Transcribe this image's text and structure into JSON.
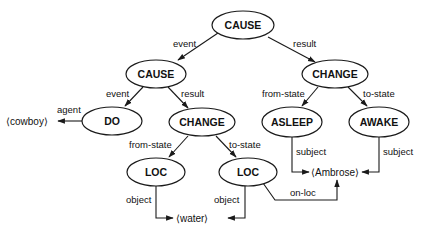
{
  "diagram": {
    "type": "conceptual-dependency-graph",
    "nodes": [
      {
        "id": "cause_root",
        "label": "CAUSE"
      },
      {
        "id": "cause_sub",
        "label": "CAUSE"
      },
      {
        "id": "change_right",
        "label": "CHANGE"
      },
      {
        "id": "do",
        "label": "DO"
      },
      {
        "id": "change_mid",
        "label": "CHANGE"
      },
      {
        "id": "asleep",
        "label": "ASLEEP"
      },
      {
        "id": "awake",
        "label": "AWAKE"
      },
      {
        "id": "loc_left",
        "label": "LOC"
      },
      {
        "id": "loc_right",
        "label": "LOC"
      }
    ],
    "leaves": [
      {
        "id": "cowboy",
        "label": "⟨cowboy⟩"
      },
      {
        "id": "ambrose",
        "label": "⟨Ambrose⟩"
      },
      {
        "id": "water",
        "label": "⟨water⟩"
      }
    ],
    "edges": [
      {
        "from": "cause_root",
        "to": "cause_sub",
        "label": "event"
      },
      {
        "from": "cause_root",
        "to": "change_right",
        "label": "result"
      },
      {
        "from": "cause_sub",
        "to": "do",
        "label": "event"
      },
      {
        "from": "cause_sub",
        "to": "change_mid",
        "label": "result"
      },
      {
        "from": "do",
        "to": "cowboy",
        "label": "agent"
      },
      {
        "from": "change_mid",
        "to": "loc_left",
        "label": "from-state"
      },
      {
        "from": "change_mid",
        "to": "loc_right",
        "label": "to-state"
      },
      {
        "from": "change_right",
        "to": "asleep",
        "label": "from-state"
      },
      {
        "from": "change_right",
        "to": "awake",
        "label": "to-state"
      },
      {
        "from": "asleep",
        "to": "ambrose",
        "label": "subject"
      },
      {
        "from": "awake",
        "to": "ambrose",
        "label": "subject"
      },
      {
        "from": "loc_left",
        "to": "water",
        "label": "object"
      },
      {
        "from": "loc_right",
        "to": "water",
        "label": "object"
      },
      {
        "from": "loc_right",
        "to": "ambrose",
        "label": "on-loc"
      }
    ]
  }
}
